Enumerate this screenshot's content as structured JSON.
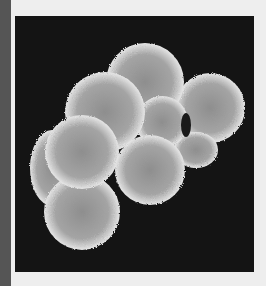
{
  "image": {
    "subject": "Scanning electron micrograph of a multi-cell embryo (cluster of spherical cells)",
    "cell_count_visible": 7
  },
  "colors": {
    "background": "#eeeeee",
    "side_strip": "#555555",
    "photo_background": "#141414",
    "cell_surface": "#9a9a9a",
    "cell_highlight": "#d8d8d8"
  }
}
